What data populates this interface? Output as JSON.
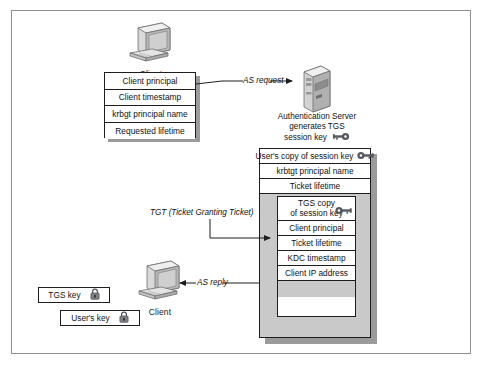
{
  "client_top": {
    "label": "Client",
    "icon": "desktop-computer-icon"
  },
  "client_bottom": {
    "label": "Client",
    "icon": "desktop-computer-icon"
  },
  "server": {
    "icon": "tower-server-icon",
    "caption_line1": "Authentication Server",
    "caption_line2": "generates TGS",
    "caption_line3": "session key",
    "key_icon": "key-icon"
  },
  "as_request_table": {
    "rows": [
      "Client principal",
      "Client timestamp",
      "krbgt principal name",
      "Requested lifetime"
    ]
  },
  "arrows": {
    "as_request": "AS request",
    "as_reply": "AS reply",
    "tgt": "TGT (Ticket Granting Ticket)"
  },
  "ticket": {
    "outer_rows": [
      {
        "text": "User's copy of session key",
        "icon": "key-icon"
      },
      {
        "text": "krbtgt principal name",
        "icon": null
      },
      {
        "text": "Ticket lifetime",
        "icon": null
      }
    ],
    "tgt_rows": [
      {
        "line1": "TGS copy",
        "line2": "of session key",
        "icon": "key-icon"
      },
      {
        "line1": "Client principal",
        "line2": null,
        "icon": null
      },
      {
        "line1": "Ticket lifetime",
        "line2": null,
        "icon": null
      },
      {
        "line1": "KDC timestamp",
        "line2": null,
        "icon": null
      },
      {
        "line1": "Client IP address",
        "line2": null,
        "icon": null
      }
    ],
    "tgs_key_bar": {
      "text": "TGS key",
      "icon": "padlock-icon"
    },
    "users_key_bar": {
      "text": "User's key",
      "icon": "padlock-icon"
    }
  },
  "colors": {
    "frame_border": "#8e8e8e",
    "line": "#1d1d1d",
    "gray_panel": "#c9c9c9",
    "shadow": "#9b9b9b",
    "text": "#111111"
  }
}
